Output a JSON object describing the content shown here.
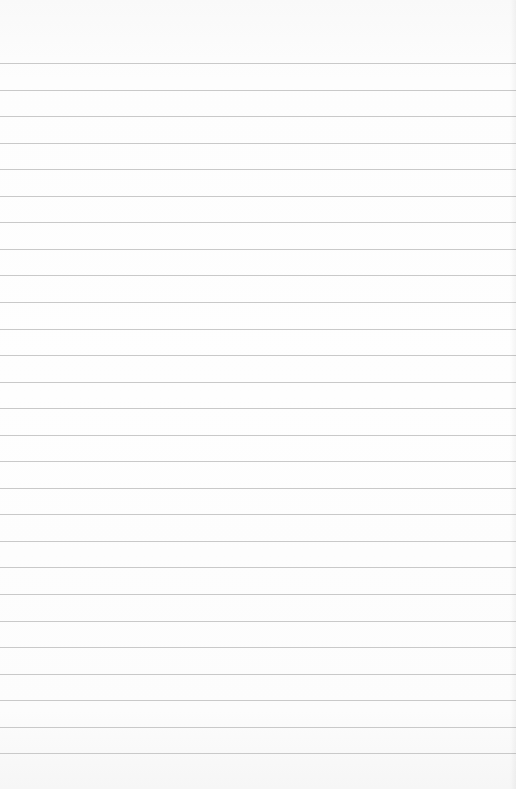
{
  "image": {
    "subject": "blank ruled notepad page",
    "background_color": "#fdfdfd",
    "line_color": "#c9c9c9",
    "first_line_y": 63,
    "line_spacing_px": 26.55,
    "line_count": 27,
    "text": ""
  }
}
